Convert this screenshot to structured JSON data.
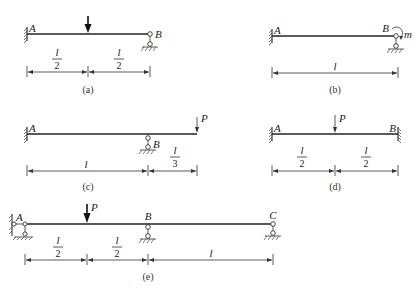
{
  "figure": {
    "panels": [
      {
        "id": "a",
        "caption": "(a)",
        "labels": {
          "left": "A",
          "right": "B"
        },
        "supports": {
          "A": "fixed",
          "B": "roller"
        },
        "loads": [
          {
            "type": "point",
            "position": "l/2",
            "label": ""
          }
        ],
        "dimensions": [
          {
            "num": "l",
            "den": "2"
          },
          {
            "num": "l",
            "den": "2"
          }
        ]
      },
      {
        "id": "b",
        "caption": "(b)",
        "labels": {
          "left": "A",
          "right": "B",
          "moment": "m"
        },
        "supports": {
          "A": "fixed",
          "B": "roller"
        },
        "loads": [
          {
            "type": "moment",
            "position": "B",
            "label": "m"
          }
        ],
        "dimensions": [
          {
            "text": "l"
          }
        ]
      },
      {
        "id": "c",
        "caption": "(c)",
        "labels": {
          "left": "A",
          "support": "B",
          "load": "P"
        },
        "supports": {
          "A": "fixed",
          "B": "roller"
        },
        "loads": [
          {
            "type": "point",
            "position": "free end",
            "label": "P"
          }
        ],
        "dimensions": [
          {
            "text": "l"
          },
          {
            "num": "l",
            "den": "3"
          }
        ]
      },
      {
        "id": "d",
        "caption": "(d)",
        "labels": {
          "left": "A",
          "right": "B",
          "load": "P"
        },
        "supports": {
          "A": "fixed",
          "B": "fixed"
        },
        "loads": [
          {
            "type": "point",
            "position": "l/2",
            "label": "P"
          }
        ],
        "dimensions": [
          {
            "num": "l",
            "den": "2"
          },
          {
            "num": "l",
            "den": "2"
          }
        ]
      },
      {
        "id": "e",
        "caption": "(e)",
        "labels": {
          "left": "A",
          "mid": "B",
          "right": "C",
          "load": "P"
        },
        "supports": {
          "A": "pinned-link",
          "B": "roller",
          "C": "roller"
        },
        "loads": [
          {
            "type": "point",
            "position": "l/2",
            "label": "P"
          }
        ],
        "dimensions": [
          {
            "num": "l",
            "den": "2"
          },
          {
            "num": "l",
            "den": "2"
          },
          {
            "text": "l"
          }
        ]
      }
    ]
  }
}
